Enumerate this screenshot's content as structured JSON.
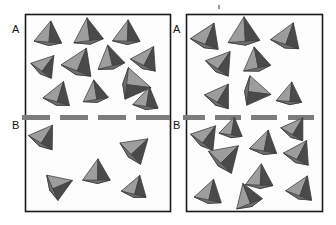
{
  "figure": {
    "title": "",
    "background_color": "#ffffff",
    "box_border_color": "#1a1a1a",
    "box_fill_color": "#fdfdfd",
    "separator_color": "#7d7d7d",
    "particle_light_face_color": "#9d9d9d",
    "particle_mid_face_color": "#6f6f6f",
    "particle_dark_face_color": "#4a4a4a",
    "particle_outline_color": "#3c3c3c"
  },
  "labels": {
    "top_region": "A",
    "bottom_region": "B"
  },
  "panels": [
    {
      "name": "left-panel",
      "box": {
        "x": 25,
        "y": 14,
        "width": 145,
        "height": 197
      },
      "separator_y": 118,
      "label_a": {
        "text": "A",
        "x": 12,
        "y": 28
      },
      "label_b": {
        "text": "B",
        "x": 12,
        "y": 124
      },
      "dashes": [
        {
          "x": 22,
          "y": 115,
          "width": 28,
          "height": 5
        },
        {
          "x": 60,
          "y": 115,
          "width": 28,
          "height": 5
        },
        {
          "x": 98,
          "y": 115,
          "width": 28,
          "height": 5
        },
        {
          "x": 136,
          "y": 115,
          "width": 34,
          "height": 5
        }
      ],
      "region_a_count": 13,
      "region_b_count": 5,
      "particles": [
        {
          "cx": 49,
          "cy": 34,
          "r": 13,
          "rot": 8,
          "region": "A"
        },
        {
          "cx": 88,
          "cy": 32,
          "r": 14,
          "rot": -4,
          "region": "A"
        },
        {
          "cx": 127,
          "cy": 33,
          "r": 13,
          "rot": 5,
          "region": "A"
        },
        {
          "cx": 46,
          "cy": 65,
          "r": 12,
          "rot": 40,
          "region": "A"
        },
        {
          "cx": 80,
          "cy": 62,
          "r": 15,
          "rot": 25,
          "region": "A"
        },
        {
          "cx": 110,
          "cy": 58,
          "r": 13,
          "rot": -10,
          "region": "A"
        },
        {
          "cx": 147,
          "cy": 58,
          "r": 13,
          "rot": 30,
          "region": "A"
        },
        {
          "cx": 136,
          "cy": 85,
          "r": 15,
          "rot": 100,
          "region": "A"
        },
        {
          "cx": 59,
          "cy": 94,
          "r": 13,
          "rot": 20,
          "region": "A"
        },
        {
          "cx": 95,
          "cy": 92,
          "r": 12,
          "rot": -6,
          "region": "A"
        },
        {
          "cx": 147,
          "cy": 99,
          "r": 12,
          "rot": 12,
          "region": "A"
        },
        {
          "cx": 45,
          "cy": 136,
          "r": 13,
          "rot": 35,
          "region": "B"
        },
        {
          "cx": 137,
          "cy": 148,
          "r": 14,
          "rot": 50,
          "region": "B"
        },
        {
          "cx": 97,
          "cy": 172,
          "r": 13,
          "rot": 4,
          "region": "B"
        },
        {
          "cx": 60,
          "cy": 185,
          "r": 13,
          "rot": 70,
          "region": "B"
        },
        {
          "cx": 136,
          "cy": 187,
          "r": 12,
          "rot": 18,
          "region": "B"
        }
      ]
    },
    {
      "name": "right-panel",
      "box": {
        "x": 186,
        "y": 14,
        "width": 136,
        "height": 197
      },
      "separator_y": 118,
      "label_a": {
        "text": "A",
        "x": 174,
        "y": 28
      },
      "label_b": {
        "text": "B",
        "x": 174,
        "y": 124
      },
      "dashes": [
        {
          "x": 183,
          "y": 115,
          "width": 22,
          "height": 5
        },
        {
          "x": 215,
          "y": 115,
          "width": 26,
          "height": 5
        },
        {
          "x": 251,
          "y": 115,
          "width": 26,
          "height": 5
        },
        {
          "x": 288,
          "y": 115,
          "width": 26,
          "height": 5
        }
      ],
      "region_a_count": 8,
      "region_b_count": 10,
      "particles": [
        {
          "cx": 208,
          "cy": 36,
          "r": 14,
          "rot": 25,
          "region": "A"
        },
        {
          "cx": 244,
          "cy": 32,
          "r": 15,
          "rot": 0,
          "region": "A"
        },
        {
          "cx": 288,
          "cy": 36,
          "r": 14,
          "rot": 22,
          "region": "A"
        },
        {
          "cx": 222,
          "cy": 62,
          "r": 13,
          "rot": 38,
          "region": "A"
        },
        {
          "cx": 256,
          "cy": 60,
          "r": 13,
          "rot": -8,
          "region": "A"
        },
        {
          "cx": 221,
          "cy": 95,
          "r": 13,
          "rot": 34,
          "region": "A"
        },
        {
          "cx": 257,
          "cy": 92,
          "r": 14,
          "rot": 100,
          "region": "A"
        },
        {
          "cx": 290,
          "cy": 94,
          "r": 12,
          "rot": 8,
          "region": "A"
        },
        {
          "cx": 207,
          "cy": 136,
          "r": 13,
          "rot": 40,
          "region": "B"
        },
        {
          "cx": 265,
          "cy": 143,
          "r": 13,
          "rot": 14,
          "region": "B"
        },
        {
          "cx": 300,
          "cy": 152,
          "r": 13,
          "rot": 30,
          "region": "B"
        },
        {
          "cx": 227,
          "cy": 156,
          "r": 15,
          "rot": 48,
          "region": "B"
        },
        {
          "cx": 260,
          "cy": 177,
          "r": 13,
          "rot": 6,
          "region": "B"
        },
        {
          "cx": 302,
          "cy": 188,
          "r": 13,
          "rot": 24,
          "region": "B"
        },
        {
          "cx": 210,
          "cy": 192,
          "r": 13,
          "rot": 16,
          "region": "B"
        },
        {
          "cx": 247,
          "cy": 196,
          "r": 13,
          "rot": -18,
          "region": "B"
        },
        {
          "cx": 296,
          "cy": 128,
          "r": 12,
          "rot": 34,
          "region": "B"
        },
        {
          "cx": 232,
          "cy": 128,
          "r": 11,
          "rot": 12,
          "region": "B"
        }
      ]
    }
  ],
  "artifacts": [
    {
      "name": "scan-speck",
      "x": 218,
      "y": 5,
      "width": 2,
      "height": 4
    }
  ]
}
